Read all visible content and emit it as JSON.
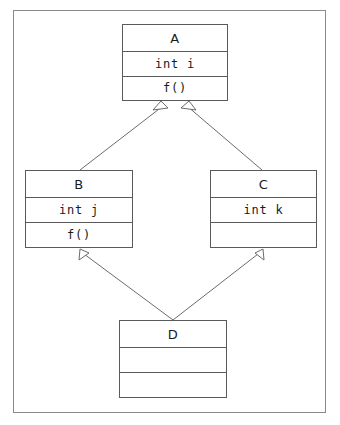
{
  "diagram": {
    "kind": "class-diagram",
    "frame": {
      "visible": true,
      "color": "#8a8a8a"
    },
    "line_color": "#6b6b6b",
    "box_border_color": "#5a5a5a",
    "background": "#ffffff",
    "classes": [
      {
        "id": "A",
        "name": "A",
        "attributes": "int i",
        "operations": "f()",
        "x": 122,
        "y": 24,
        "w": 106,
        "h": 77
      },
      {
        "id": "B",
        "name": "B",
        "attributes": "int j",
        "operations": "f()",
        "x": 25,
        "y": 170,
        "w": 108,
        "h": 78
      },
      {
        "id": "C",
        "name": "C",
        "attributes": "int k",
        "operations": "",
        "x": 210,
        "y": 170,
        "w": 107,
        "h": 78
      },
      {
        "id": "D",
        "name": "D",
        "attributes": "",
        "operations": "",
        "x": 119,
        "y": 320,
        "w": 108,
        "h": 78
      }
    ],
    "relationships": [
      {
        "type": "generalization",
        "from": "B",
        "to": "A",
        "arrowhead": "hollow-triangle",
        "label": ""
      },
      {
        "type": "generalization",
        "from": "C",
        "to": "A",
        "arrowhead": "hollow-triangle",
        "label": ""
      },
      {
        "type": "generalization",
        "from": "D",
        "to": "B",
        "arrowhead": "hollow-triangle",
        "label": ""
      },
      {
        "type": "generalization",
        "from": "D",
        "to": "C",
        "arrowhead": "hollow-triangle",
        "label": ""
      }
    ]
  }
}
